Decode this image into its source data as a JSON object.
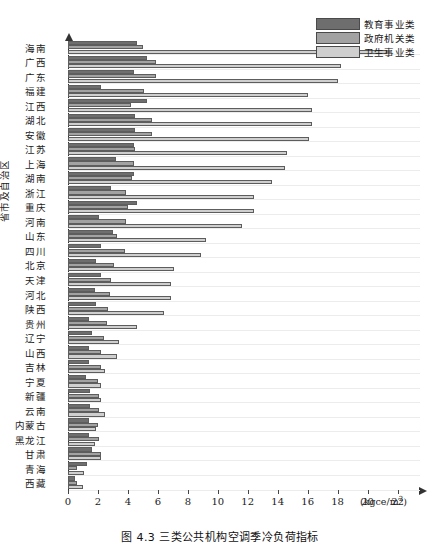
{
  "figure": {
    "caption": "图 4.3  三类公共机构空调季冷负荷指标",
    "ylabel": "省市及自治区",
    "unit": "(kgce/m",
    "unit_sup": "2",
    "unit_tail": ")"
  },
  "legend": {
    "position": "top-right",
    "items": [
      {
        "label": "教育事业类",
        "color": "#6e6e6e",
        "key": "edu"
      },
      {
        "label": "政府机关类",
        "color": "#a2a2a2",
        "key": "gov"
      },
      {
        "label": "卫生事业类",
        "color": "#cfcfcf",
        "key": "med"
      }
    ]
  },
  "chart_data": {
    "type": "bar",
    "orientation": "horizontal",
    "title": "图 4.3  三类公共机构空调季冷负荷指标",
    "xlabel": "(kgce/m2)",
    "ylabel": "省市及自治区",
    "xlim": [
      0,
      23.5
    ],
    "xticks": [
      0,
      2,
      4,
      6,
      8,
      10,
      12,
      14,
      16,
      18,
      20,
      22
    ],
    "grid": "horizontal",
    "legend_position": "top-right",
    "categories": [
      "海南",
      "广西",
      "广东",
      "福建",
      "江西",
      "湖北",
      "安徽",
      "江苏",
      "上海",
      "湖南",
      "浙江",
      "重庆",
      "河南",
      "山东",
      "四川",
      "北京",
      "天津",
      "河北",
      "陕西",
      "贵州",
      "辽宁",
      "山西",
      "吉林",
      "宁夏",
      "新疆",
      "云南",
      "内蒙古",
      "黑龙江",
      "甘肃",
      "青海",
      "西藏"
    ],
    "series": [
      {
        "name": "教育事业类",
        "color": "#6e6e6e",
        "values": [
          4.6,
          5.3,
          4.4,
          2.2,
          5.3,
          4.5,
          4.5,
          4.4,
          3.2,
          4.4,
          2.9,
          4.6,
          2.1,
          3.0,
          2.2,
          1.9,
          2.2,
          1.8,
          1.9,
          1.4,
          1.6,
          1.4,
          1.4,
          1.2,
          1.5,
          1.5,
          1.4,
          1.4,
          1.6,
          1.3,
          0.5
        ]
      },
      {
        "name": "政府机关类",
        "color": "#a2a2a2",
        "values": [
          5.0,
          5.9,
          5.9,
          5.1,
          4.2,
          5.6,
          5.6,
          4.5,
          4.4,
          4.3,
          3.9,
          4.0,
          3.9,
          3.3,
          3.8,
          3.1,
          2.9,
          2.8,
          2.7,
          2.6,
          2.4,
          2.2,
          2.2,
          2.0,
          2.1,
          2.1,
          2.0,
          2.1,
          2.2,
          0.6,
          0.6
        ]
      },
      {
        "name": "卫生事业类",
        "color": "#cfcfcf",
        "values": [
          21.3,
          18.2,
          18.0,
          16.0,
          16.3,
          16.3,
          16.1,
          14.6,
          14.5,
          13.6,
          12.4,
          12.4,
          11.6,
          9.2,
          8.9,
          7.1,
          6.9,
          6.9,
          6.4,
          4.6,
          3.4,
          3.3,
          2.5,
          2.2,
          2.2,
          2.5,
          1.9,
          1.8,
          2.2,
          1.1,
          1.0
        ]
      }
    ]
  }
}
